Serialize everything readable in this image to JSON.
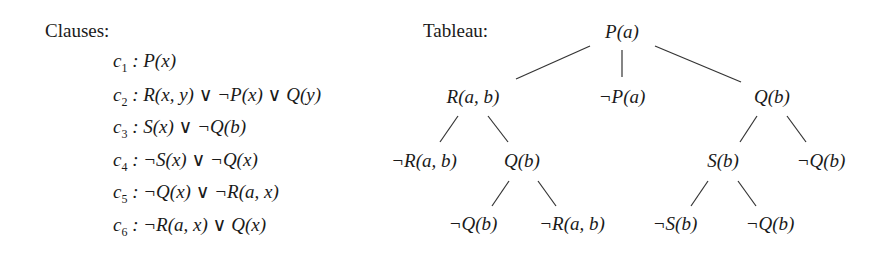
{
  "clauses": {
    "heading": "Clauses:",
    "items": [
      {
        "name": "c",
        "index": "1",
        "formula": ": P(x)"
      },
      {
        "name": "c",
        "index": "2",
        "formula": ": R(x, y) ∨ ¬P(x) ∨ Q(y)"
      },
      {
        "name": "c",
        "index": "3",
        "formula": ": S(x) ∨ ¬Q(b)"
      },
      {
        "name": "c",
        "index": "4",
        "formula": ": ¬S(x) ∨ ¬Q(x)"
      },
      {
        "name": "c",
        "index": "5",
        "formula": ": ¬Q(x) ∨ ¬R(a, x)"
      },
      {
        "name": "c",
        "index": "6",
        "formula": ": ¬R(a, x) ∨ Q(x)"
      }
    ]
  },
  "tableau": {
    "heading": "Tableau:",
    "root": "P(a)",
    "level1": [
      "R(a, b)",
      "¬P(a)",
      "Q(b)"
    ],
    "level2": [
      "¬R(a, b)",
      "Q(b)",
      "S(b)",
      "¬Q(b)"
    ],
    "level3": [
      "¬Q(b)",
      "¬R(a, b)",
      "¬S(b)",
      "¬Q(b)"
    ]
  }
}
